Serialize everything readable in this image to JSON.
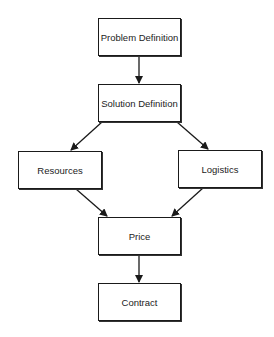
{
  "diagram": {
    "type": "flowchart",
    "nodes": [
      {
        "id": "problem",
        "label": "Problem Definition"
      },
      {
        "id": "solution",
        "label": "Solution Definition"
      },
      {
        "id": "resources",
        "label": "Resources"
      },
      {
        "id": "logistics",
        "label": "Logistics"
      },
      {
        "id": "price",
        "label": "Price"
      },
      {
        "id": "contract",
        "label": "Contract"
      }
    ],
    "edges": [
      {
        "from": "problem",
        "to": "solution"
      },
      {
        "from": "solution",
        "to": "resources"
      },
      {
        "from": "solution",
        "to": "logistics"
      },
      {
        "from": "resources",
        "to": "price"
      },
      {
        "from": "logistics",
        "to": "price"
      },
      {
        "from": "price",
        "to": "contract"
      }
    ],
    "colors": {
      "stroke": "#1a1a1a",
      "text": "#222222",
      "background": "#ffffff"
    }
  }
}
